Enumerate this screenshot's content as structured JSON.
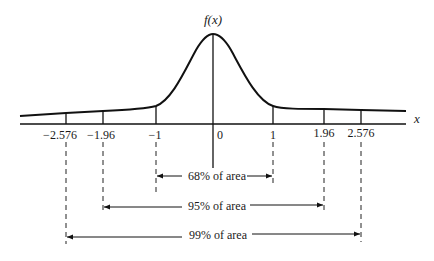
{
  "diagram": {
    "y_label": "f(x)",
    "x_label": "x",
    "ticks": [
      {
        "label": "−2.576",
        "value": -2.576,
        "px": 66
      },
      {
        "label": "−1.96",
        "value": -1.96,
        "px": 103
      },
      {
        "label": "−1",
        "value": -1,
        "px": 156
      },
      {
        "label": "0",
        "value": 0,
        "px": 213
      },
      {
        "label": "1",
        "value": 1,
        "px": 273
      },
      {
        "label": "1.96",
        "value": 1.96,
        "px": 324
      },
      {
        "label": "2.576",
        "value": 2.576,
        "px": 361
      }
    ],
    "intervals": [
      {
        "label": "68% of area",
        "from": -1,
        "to": 1
      },
      {
        "label": "95% of area",
        "from": -1.96,
        "to": 1.96
      },
      {
        "label": "99% of area",
        "from": -2.576,
        "to": 2.576
      }
    ],
    "colors": {
      "ink": "#111111",
      "background": "#ffffff"
    }
  }
}
